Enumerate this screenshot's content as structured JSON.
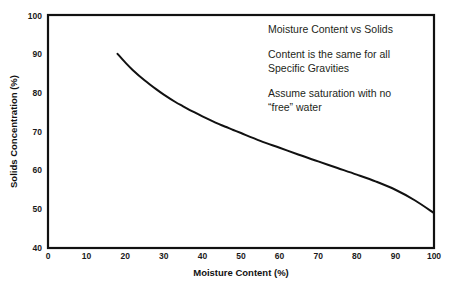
{
  "chart_data": {
    "type": "line",
    "title": "",
    "xlabel": "Moisture Content (%)",
    "ylabel": "Solids Concentration (%)",
    "xlim": [
      0,
      100
    ],
    "ylim": [
      40,
      100
    ],
    "xticks": [
      0,
      10,
      20,
      30,
      40,
      50,
      60,
      70,
      80,
      90,
      100
    ],
    "yticks": [
      40,
      50,
      60,
      70,
      80,
      90,
      100
    ],
    "grid": true,
    "legend": "none",
    "series": [
      {
        "name": "Solids Concentration",
        "x": [
          18,
          20,
          22,
          25,
          28,
          30,
          33,
          35,
          38,
          40,
          43,
          45,
          48,
          50,
          55,
          60,
          65,
          70,
          75,
          80,
          85,
          90,
          95,
          100
        ],
        "y": [
          90.0,
          87.8,
          85.8,
          83.2,
          80.9,
          79.5,
          77.6,
          76.5,
          74.9,
          73.9,
          72.5,
          71.6,
          70.4,
          69.6,
          67.6,
          65.8,
          64.0,
          62.3,
          60.6,
          58.9,
          57.1,
          55.0,
          52.3,
          49.0
        ]
      }
    ],
    "annotations": [
      "Moisture Content vs Solids",
      "Content is the same for all",
      "Specific Gravities",
      "Assume saturation with no",
      "“free” water"
    ],
    "annotation_blocks": [
      {
        "lines": [
          "Moisture Content vs Solids"
        ]
      },
      {
        "lines": [
          "Content is the same for all",
          "Specific Gravities"
        ]
      },
      {
        "lines": [
          "Assume saturation with no",
          "“free” water"
        ]
      }
    ],
    "colors": {
      "curve": "#111111",
      "frame": "#111111",
      "grid": "#e9e9ee",
      "background": "#ffffff",
      "text": "#231f20"
    }
  }
}
